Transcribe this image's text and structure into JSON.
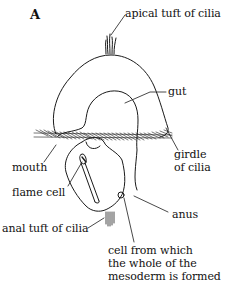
{
  "figure": {
    "panel_label": "A",
    "stroke_color": "#1a1a1a",
    "background": "#ffffff"
  },
  "labels": {
    "apical_tuft": "apical tuft of cilia",
    "gut": "gut",
    "girdle_line1": "girdle",
    "girdle_line2": "of cilia",
    "mouth": "mouth",
    "flame_cell": "flame cell",
    "anus": "anus",
    "anal_tuft": "anal tuft of cilia",
    "mesoderm_line1": "cell from which",
    "mesoderm_line2": "the whole of the",
    "mesoderm_line3": "mesoderm is formed"
  }
}
